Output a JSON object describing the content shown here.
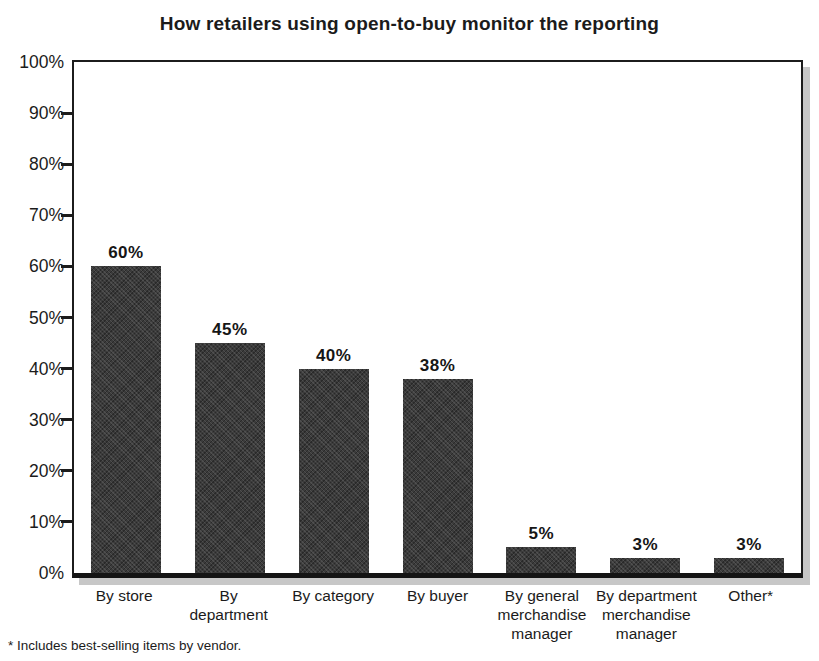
{
  "title": "How retailers using open-to-buy monitor the reporting",
  "footnote": "* Includes best-selling items by vendor.",
  "colors": {
    "bar": "#3b3b3b",
    "axis": "#1c1c1c",
    "shadow": "#c7c7c7",
    "text": "#1a1a1a",
    "background": "#ffffff"
  },
  "chart_data": {
    "type": "bar",
    "title": "How retailers using open-to-buy monitor the reporting",
    "categories": [
      "By store",
      "By department",
      "By category",
      "By buyer",
      "By general merchandise manager",
      "By department merchandise manager",
      "Other*"
    ],
    "category_lines": [
      [
        "By store"
      ],
      [
        "By",
        "department"
      ],
      [
        "By category"
      ],
      [
        "By buyer"
      ],
      [
        "By general",
        "merchandise",
        "manager"
      ],
      [
        "By department",
        "merchandise",
        "manager"
      ],
      [
        "Other*"
      ]
    ],
    "values": [
      60,
      45,
      40,
      38,
      5,
      3,
      3
    ],
    "value_labels": [
      "60%",
      "45%",
      "40%",
      "38%",
      "5%",
      "3%",
      "3%"
    ],
    "xlabel": "",
    "ylabel": "",
    "ylim": [
      0,
      100
    ],
    "y_tick_step": 10,
    "y_tick_labels": [
      "100%",
      "90%",
      "80%",
      "70%",
      "60%",
      "50%",
      "40%",
      "30%",
      "20%",
      "10%",
      "0%"
    ],
    "grid": false,
    "legend": "none",
    "footnote": "* Includes best-selling items by vendor."
  }
}
